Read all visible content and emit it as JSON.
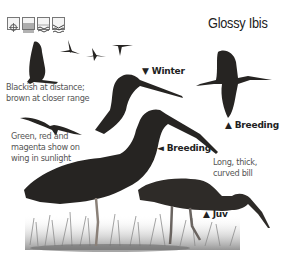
{
  "title": "Glossy Ibis",
  "habitat_icons": [
    {
      "name": "scrub-icon"
    },
    {
      "name": "grassland-icon"
    },
    {
      "name": "wetland-icon"
    },
    {
      "name": "water-icon"
    }
  ],
  "notes": {
    "distance": [
      "Blackish at distance;",
      "brown at closer range"
    ],
    "wing": [
      "Green, red and",
      "magenta show on",
      "wing in sunlight"
    ],
    "bill": [
      "Long, thick,",
      "curved bill"
    ]
  },
  "labels": {
    "winter": {
      "arrow": "▼",
      "text": "Winter"
    },
    "breeding_flight": {
      "arrow": "▲",
      "text": "Breeding"
    },
    "breeding_standing": {
      "arrow": "◄",
      "text": "Breeding"
    },
    "juvenile": {
      "arrow": "▲",
      "text": "Juv"
    }
  },
  "colors": {
    "bird": "#262422",
    "grass": "#9a9a9a",
    "text": "#555555"
  }
}
